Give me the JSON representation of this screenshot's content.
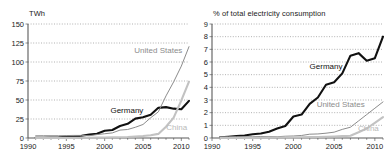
{
  "figure": {
    "panels": [
      {
        "id": "left",
        "axis_title": "TWh",
        "chart_data": {
          "type": "line",
          "title": "TWh",
          "xlabel": "",
          "ylabel": "TWh",
          "xlim": [
            1990,
            2011
          ],
          "ylim": [
            0,
            150
          ],
          "yticks": [
            0,
            25,
            50,
            75,
            100,
            125,
            150
          ],
          "xticks": [
            1990,
            1995,
            2000,
            2005,
            2010
          ],
          "xticklabels": [
            "1990",
            "1995",
            "2000",
            "2005",
            "2010"
          ],
          "yticklabels": [
            "0",
            "25",
            "50",
            "75",
            "100",
            "125",
            "150"
          ],
          "grid": true,
          "legend": "inline-annotations",
          "x": [
            1991,
            1992,
            1993,
            1994,
            1995,
            1996,
            1997,
            1998,
            1999,
            2000,
            2001,
            2002,
            2003,
            2004,
            2005,
            2006,
            2007,
            2008,
            2009,
            2010,
            2011
          ],
          "series": [
            {
              "name": "Germany",
              "color": "#111111",
              "values": [
                0.2,
                0.3,
                0.6,
                0.9,
                1.5,
                2.0,
                3.0,
                4.5,
                5.5,
                9.5,
                10.5,
                15.8,
                18.7,
                25.5,
                27.2,
                30.7,
                39.7,
                40.6,
                38.6,
                37.8,
                48.9
              ]
            },
            {
              "name": "United States",
              "color": "#8c8c8c",
              "values": [
                2.9,
                3.0,
                3.0,
                3.0,
                3.2,
                3.4,
                3.4,
                3.0,
                4.5,
                5.6,
                6.7,
                10.4,
                11.2,
                14.1,
                17.8,
                26.6,
                34.4,
                55.4,
                73.9,
                94.6,
                120.2
              ]
            },
            {
              "name": "China",
              "color": "#c2c2c2",
              "values": [
                0.0,
                0.0,
                0.1,
                0.1,
                0.1,
                0.2,
                0.3,
                0.4,
                0.5,
                0.6,
                0.8,
                1.0,
                1.3,
                2.0,
                2.6,
                3.7,
                5.4,
                14.8,
                26.9,
                49.4,
                74.1
              ]
            }
          ],
          "annotations": [
            {
              "text": "United States",
              "x": 2007.0,
              "y": 112,
              "color": "#8c8c8c"
            },
            {
              "text": "Germany",
              "x": 2002.9,
              "y": 33,
              "color": "#111111"
            },
            {
              "text": "China",
              "x": 2009.4,
              "y": 10,
              "color": "#b9b9b9"
            }
          ]
        }
      },
      {
        "id": "right",
        "axis_title": "% of total electricity consumption",
        "chart_data": {
          "type": "line",
          "title": "% of total electricity consumption",
          "xlabel": "",
          "ylabel": "% of total electricity consumption",
          "xlim": [
            1990,
            2011
          ],
          "ylim": [
            0,
            9
          ],
          "yticks": [
            0,
            1,
            2,
            3,
            4,
            5,
            6,
            7,
            8,
            9
          ],
          "xticks": [
            1990,
            1995,
            2000,
            2005,
            2010
          ],
          "xticklabels": [
            "1990",
            "1995",
            "2000",
            "2005",
            "2010"
          ],
          "yticklabels": [
            "0",
            "1",
            "2",
            "3",
            "4",
            "5",
            "6",
            "7",
            "8",
            "9"
          ],
          "grid": true,
          "legend": "inline-annotations",
          "x": [
            1991,
            1992,
            1993,
            1994,
            1995,
            1996,
            1997,
            1998,
            1999,
            2000,
            2001,
            2002,
            2003,
            2004,
            2005,
            2006,
            2007,
            2008,
            2009,
            2010,
            2011
          ],
          "series": [
            {
              "name": "Germany",
              "color": "#111111",
              "values": [
                0.05,
                0.1,
                0.15,
                0.2,
                0.3,
                0.35,
                0.5,
                0.75,
                0.95,
                1.7,
                1.85,
                2.7,
                3.2,
                4.2,
                4.4,
                5.1,
                6.5,
                6.7,
                6.1,
                6.3,
                8.0
              ]
            },
            {
              "name": "United States",
              "color": "#8c8c8c",
              "values": [
                0.1,
                0.1,
                0.1,
                0.1,
                0.1,
                0.12,
                0.12,
                0.1,
                0.14,
                0.16,
                0.2,
                0.3,
                0.32,
                0.38,
                0.46,
                0.68,
                0.85,
                1.35,
                1.85,
                2.35,
                2.85
              ]
            },
            {
              "name": "China",
              "color": "#c2c2c2",
              "values": [
                0.0,
                0.0,
                0.01,
                0.01,
                0.01,
                0.02,
                0.03,
                0.04,
                0.04,
                0.05,
                0.06,
                0.07,
                0.08,
                0.1,
                0.12,
                0.15,
                0.18,
                0.45,
                0.75,
                1.2,
                1.65
              ]
            }
          ],
          "annotations": [
            {
              "text": "Germany",
              "x": 2004.0,
              "y": 5.45,
              "color": "#111111"
            },
            {
              "text": "United States",
              "x": 2005.8,
              "y": 2.45,
              "color": "#8c8c8c"
            },
            {
              "text": "China",
              "x": 2009.2,
              "y": 0.52,
              "color": "#b9b9b9"
            }
          ]
        }
      }
    ]
  }
}
